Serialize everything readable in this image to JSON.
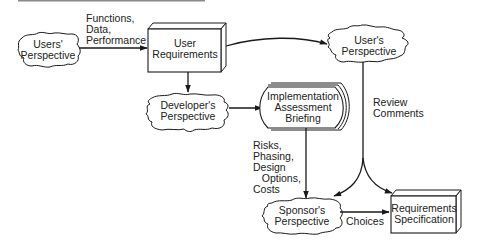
{
  "diagram": {
    "nodes": [
      {
        "id": "users-perspective",
        "shape": "cloud",
        "lines": [
          "Users'",
          "Perspective"
        ]
      },
      {
        "id": "user-requirements",
        "shape": "3d-box",
        "lines": [
          "User",
          "Requirements"
        ]
      },
      {
        "id": "user-s-perspective",
        "shape": "cloud",
        "lines": [
          "User's",
          "Perspective"
        ]
      },
      {
        "id": "developers-perspective",
        "shape": "cloud",
        "lines": [
          "Developer's",
          "Perspective"
        ]
      },
      {
        "id": "implementation-briefing",
        "shape": "document-stack",
        "lines": [
          "Implementation",
          "Assessment",
          "Briefing"
        ]
      },
      {
        "id": "sponsors-perspective",
        "shape": "cloud",
        "lines": [
          "Sponsor's",
          "Perspective"
        ]
      },
      {
        "id": "requirements-specification",
        "shape": "3d-box",
        "lines": [
          "Requirements",
          "Specification"
        ]
      }
    ],
    "edges": [
      {
        "from": "users-perspective",
        "to": "user-requirements",
        "label": "Functions,\nData,\nPerformance"
      },
      {
        "from": "user-requirements",
        "to": "user-s-perspective",
        "label": ""
      },
      {
        "from": "user-requirements",
        "to": "developers-perspective",
        "label": ""
      },
      {
        "from": "developers-perspective",
        "to": "implementation-briefing",
        "label": ""
      },
      {
        "from": "user-s-perspective",
        "to": "sponsors-perspective",
        "label": "Review\nComments"
      },
      {
        "from": "user-s-perspective",
        "to": "requirements-specification",
        "label": "Review\nComments"
      },
      {
        "from": "implementation-briefing",
        "to": "sponsors-perspective",
        "label": "Risks,\nPhasing,\nDesign\n   Options,\nCosts"
      },
      {
        "from": "sponsors-perspective",
        "to": "requirements-specification",
        "label": "Choices"
      }
    ]
  },
  "labels": {
    "users_perspective": "Users'\nPerspective",
    "user_requirements": "User\nRequirements",
    "user_s_perspective": "User's\nPerspective",
    "developers_perspective": "Developer's\nPerspective",
    "implementation_briefing": "Implementation\nAssessment\nBriefing",
    "sponsors_perspective": "Sponsor's\nPerspective",
    "requirements_specification": "Requirements\nSpecification",
    "edge_functions": "Functions,\nData,\nPerformance",
    "edge_review": "Review\nComments",
    "edge_risks": "Risks,\nPhasing,\nDesign\n   Options,\nCosts",
    "edge_choices": "Choices"
  },
  "colors": {
    "stroke": "#1a1a1a",
    "text": "#222222",
    "background": "#ffffff",
    "top_rule": "#8a8a8a"
  }
}
